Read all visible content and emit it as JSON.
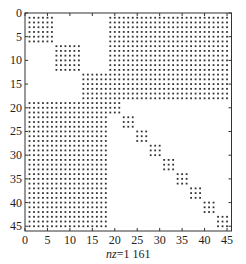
{
  "chart_data": {
    "type": "scatter",
    "subtype": "sparsity-pattern (spy)",
    "title": "",
    "xlabel": "nz=1 161",
    "xlabel_prefix": "nz",
    "xlabel_value": "=1 161",
    "ylabel": "",
    "matrix_size": 45,
    "nnz": 1161,
    "xlim": [
      0,
      46
    ],
    "ylim": [
      46,
      0
    ],
    "x_ticks": [
      0,
      5,
      10,
      15,
      20,
      25,
      30,
      35,
      40,
      45
    ],
    "y_ticks": [
      0,
      5,
      10,
      15,
      20,
      25,
      30,
      35,
      40,
      45
    ],
    "grid": false,
    "marker_color": "#333333",
    "blocks": [
      {
        "name": "diag-block-1",
        "rows": [
          1,
          6
        ],
        "cols": [
          1,
          6
        ]
      },
      {
        "name": "diag-block-2",
        "rows": [
          7,
          12
        ],
        "cols": [
          7,
          12
        ]
      },
      {
        "name": "diag-block-3",
        "rows": [
          13,
          18
        ],
        "cols": [
          13,
          18
        ]
      },
      {
        "name": "border-top-right",
        "rows": [
          1,
          18
        ],
        "cols": [
          19,
          45
        ]
      },
      {
        "name": "border-bottom-left",
        "rows": [
          19,
          45
        ],
        "cols": [
          1,
          18
        ]
      },
      {
        "name": "small-diag-1",
        "rows": [
          19,
          21
        ],
        "cols": [
          19,
          21
        ]
      },
      {
        "name": "small-diag-2",
        "rows": [
          22,
          24
        ],
        "cols": [
          22,
          24
        ]
      },
      {
        "name": "small-diag-3",
        "rows": [
          25,
          27
        ],
        "cols": [
          25,
          27
        ]
      },
      {
        "name": "small-diag-4",
        "rows": [
          28,
          30
        ],
        "cols": [
          28,
          30
        ]
      },
      {
        "name": "small-diag-5",
        "rows": [
          31,
          33
        ],
        "cols": [
          31,
          33
        ]
      },
      {
        "name": "small-diag-6",
        "rows": [
          34,
          36
        ],
        "cols": [
          34,
          36
        ]
      },
      {
        "name": "small-diag-7",
        "rows": [
          37,
          39
        ],
        "cols": [
          37,
          39
        ]
      },
      {
        "name": "small-diag-8",
        "rows": [
          40,
          42
        ],
        "cols": [
          40,
          42
        ]
      },
      {
        "name": "small-diag-9",
        "rows": [
          43,
          45
        ],
        "cols": [
          43,
          45
        ]
      }
    ]
  },
  "layout": {
    "frame_left": 25,
    "frame_top": 13,
    "frame_right": 231.5,
    "frame_bottom": 231
  }
}
